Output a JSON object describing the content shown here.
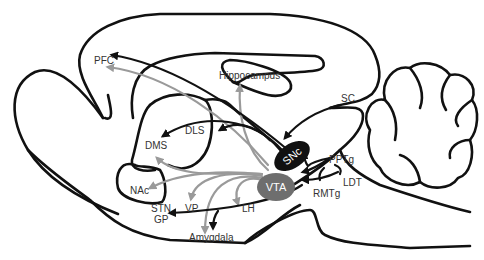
{
  "diagram": {
    "type": "sagittal-brain-dopamine-circuit",
    "colors": {
      "outline": "#111111",
      "projection_black": "#111111",
      "projection_gray": "#9a9a9a",
      "snc_fill": "#111111",
      "vta_fill": "#6e6e6e",
      "label_text": "#333333",
      "nucleus_label_text": "#ffffff"
    },
    "regions": {
      "pfc": "PFC",
      "hippocampus": "Hippocampus",
      "sc": "SC",
      "dls": "DLS",
      "dms": "DMS",
      "snc": "SNc",
      "vta": "VTA",
      "pptg": "PPTg",
      "ldt": "LDT",
      "rmtg": "RMTg",
      "nac": "NAc",
      "stn": "STN",
      "gp": "GP",
      "vp": "VP",
      "lh": "LH",
      "amygdala": "Amygdala"
    },
    "nodes": [
      {
        "id": "snc",
        "label": "SNc",
        "shape": "ellipse",
        "fill": "#111111"
      },
      {
        "id": "vta",
        "label": "VTA",
        "shape": "ellipse",
        "fill": "#6e6e6e"
      }
    ],
    "edges": [
      {
        "from": "SNc",
        "to": "PFC",
        "color": "black"
      },
      {
        "from": "VTA",
        "to": "PFC",
        "color": "gray"
      },
      {
        "from": "SNc",
        "to": "DLS",
        "color": "black"
      },
      {
        "from": "SNc",
        "to": "DMS",
        "color": "black"
      },
      {
        "from": "VTA",
        "to": "DMS",
        "color": "gray"
      },
      {
        "from": "VTA",
        "to": "NAc",
        "color": "gray"
      },
      {
        "from": "VTA",
        "to": "VP",
        "color": "gray"
      },
      {
        "from": "VTA",
        "to": "Amygdala",
        "color": "gray"
      },
      {
        "from": "VTA",
        "to": "LH",
        "color": "gray"
      },
      {
        "from": "VTA",
        "to": "Hippocampus",
        "color": "gray"
      },
      {
        "from": "SNc",
        "to": "STN/GP",
        "color": "black"
      },
      {
        "from": "SNc",
        "to": "Amygdala",
        "color": "black"
      },
      {
        "from": "SC",
        "to": "SNc",
        "color": "black"
      },
      {
        "from": "PPTg",
        "to": "SNc",
        "color": "black"
      },
      {
        "from": "PPTg",
        "to": "VTA",
        "color": "black"
      },
      {
        "from": "LDT",
        "to": "VTA",
        "color": "black"
      },
      {
        "from": "RMTg",
        "to": "VTA",
        "color": "black"
      }
    ]
  }
}
